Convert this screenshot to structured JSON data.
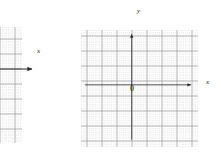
{
  "figure": {
    "kind": "cartesian-grid-pair",
    "background_color": "#ffffff",
    "width": 221,
    "height": 160
  },
  "chart_data": {
    "type": "scatter",
    "title": "",
    "subtitle": "",
    "xlabel": "x",
    "ylabel": "y",
    "grid": true,
    "legend_position": "none",
    "annotations": [
      "0"
    ],
    "series": [],
    "panels": [
      {
        "name": "left-grid",
        "description": "partially visible coordinate grid cropped by the left edge of the figure",
        "visible_axes": [
          "x"
        ],
        "xlabel": "x",
        "ylabel": "",
        "origin_label": "",
        "minor_step": 1,
        "major_step": 5,
        "minor_cell_px": 3,
        "major_cell_px": 15,
        "columns_visible": 17,
        "rows_visible": 39,
        "x_axis_row_from_top": 14,
        "grid_color_minor": "#c9c9c9",
        "grid_color_major": "#9a9a9a",
        "axis_color": "#2b2b2b"
      },
      {
        "name": "right-grid",
        "description": "complete four-quadrant coordinate plane with labeled axes and origin",
        "visible_axes": [
          "x",
          "y"
        ],
        "xlabel": "x",
        "ylabel": "y",
        "origin_label": "0",
        "minor_step": 1,
        "major_step": 5,
        "minor_cell_px": 3,
        "major_cell_px": 15,
        "columns_visible": 39,
        "rows_visible": 39,
        "x_axis_row_from_top": 17,
        "y_axis_col_from_left": 17,
        "grid_color_minor": "#c9c9c9",
        "grid_color_major": "#9a9a9a",
        "axis_color": "#2b2b2b"
      }
    ]
  },
  "labels": {
    "left_x": "x",
    "right_x": "x",
    "right_y": "y",
    "right_origin": "0"
  },
  "colors": {
    "axis": "#2b2b2b",
    "grid_minor": "#c9c9c9",
    "grid_major": "#9a9a9a",
    "text": "#1a1a1a",
    "background": "#ffffff"
  }
}
